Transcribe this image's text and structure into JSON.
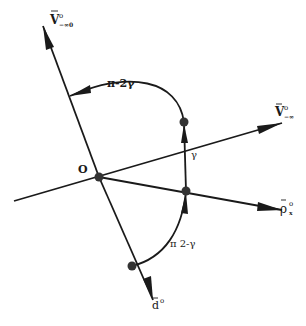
{
  "diagram": {
    "origin_label": "O",
    "vectors": [
      {
        "id": "v_minus0",
        "label": "V̄°₋₀",
        "label_main": "V",
        "label_sup": "o",
        "label_sub": "−∞0"
      },
      {
        "id": "v_minus_s",
        "label": "V̄°₋∞",
        "label_main": "V",
        "label_sup": "o",
        "label_sub": "−∞"
      },
      {
        "id": "rho_x",
        "label": "ρ̄°x",
        "label_main": "ρ",
        "label_sup": "o",
        "label_sub": "x"
      },
      {
        "id": "d",
        "label": "d̄°",
        "label_main": "d",
        "label_sup": "o",
        "label_sub": ""
      }
    ],
    "angles": [
      {
        "id": "arc_top",
        "label": "π-2γ"
      },
      {
        "id": "arc_mid",
        "label": "γ"
      },
      {
        "id": "arc_bottom",
        "label": "π 2-γ"
      }
    ],
    "colors": {
      "stroke": "#1a1a1a",
      "background": "#ffffff"
    }
  }
}
